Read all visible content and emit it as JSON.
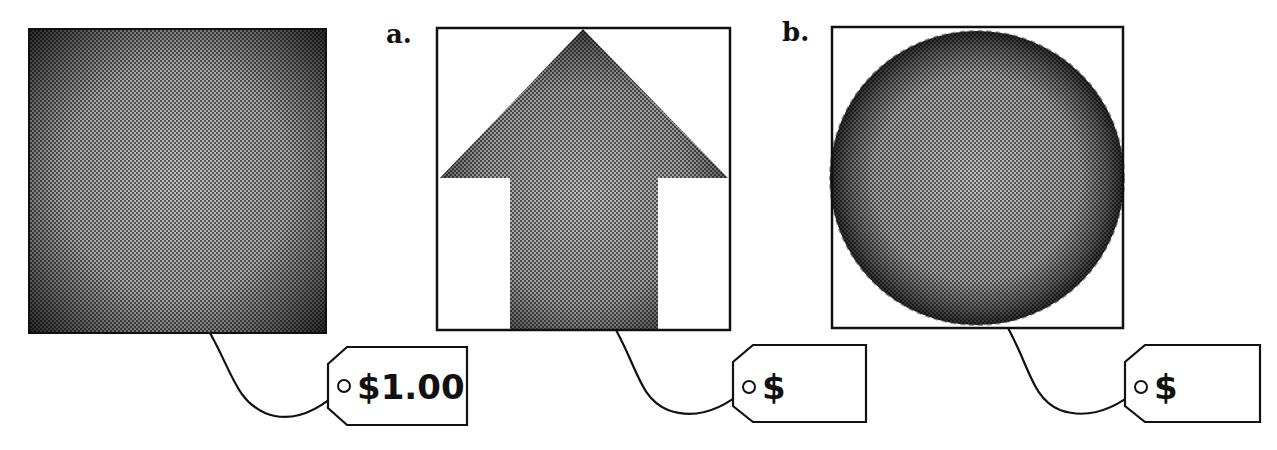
{
  "panels": [
    {
      "id": "original",
      "label": "",
      "shape": "square",
      "price": "$1.00"
    },
    {
      "id": "a",
      "label": "a.",
      "shape": "arrow",
      "price": "$"
    },
    {
      "id": "b",
      "label": "b.",
      "shape": "circle",
      "price": "$"
    }
  ],
  "colors": {
    "stroke": "#111111",
    "fill_edge": "#3a3a3a",
    "fill_center": "#b8b8b8",
    "background": "#ffffff"
  }
}
